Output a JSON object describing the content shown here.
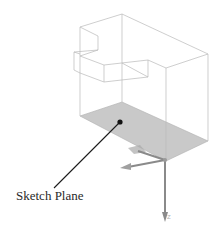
{
  "figure": {
    "callout_label": "Sketch Plane",
    "axis_label_z": "Z",
    "colors": {
      "background": "#ffffff",
      "wireframe": "#b9b9b9",
      "sketch_plane_fill": "#c9c9c9",
      "leader_line": "#1a1a1a",
      "axis_arrows": "#8a8a8a",
      "label_text": "#2a2a2a"
    },
    "elements": {
      "wireframe_solid": "stepped-block-wireframe",
      "sketch_plane": "highlighted-bottom-face",
      "triad": "coordinate-axes-at-origin"
    }
  }
}
